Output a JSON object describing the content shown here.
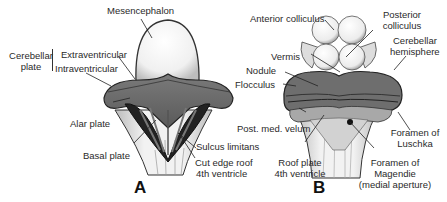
{
  "figure": {
    "panels": [
      {
        "letter": "A",
        "labels": {
          "mesencephalon": "Mesencephalon",
          "cerebellar_plate_line1": "Cerebellar",
          "cerebellar_plate_line2": "plate",
          "extraventricular": "Extraventricular",
          "intraventricular": "Intraventricular",
          "alar_plate": "Alar plate",
          "sulcus_limitans": "Sulcus limitans",
          "basal_plate": "Basal plate",
          "cut_edge_line1": "Cut edge roof",
          "cut_edge_line2": "4th ventricle"
        }
      },
      {
        "letter": "B",
        "labels": {
          "anterior_colliculus": "Anterior colliculus",
          "posterior_colliculus_line1": "Posterior",
          "posterior_colliculus_line2": "colliculus",
          "cerebellar_hemisphere_line1": "Cerebellar",
          "cerebellar_hemisphere_line2": "hemisphere",
          "vermis": "Vermis",
          "nodule": "Nodule",
          "flocculus": "Flocculus",
          "post_med_velum": "Post. med. velum",
          "foramen_luschka_line1": "Foramen of",
          "foramen_luschka_line2": "Luschka",
          "roof_plate_line1": "Roof plate",
          "roof_plate_line2": "4th ventricle",
          "foramen_magendie_line1": "Foramen of",
          "foramen_magendie_line2": "Magendie",
          "foramen_magendie_line3": "(medial aperture)"
        }
      }
    ],
    "colors": {
      "tissue_dark": "#5a5a5a",
      "tissue_mid": "#8c8c8c",
      "tissue_light": "#e8e8e8",
      "outline": "#222222",
      "ventricle": "#1a1a1a"
    }
  }
}
